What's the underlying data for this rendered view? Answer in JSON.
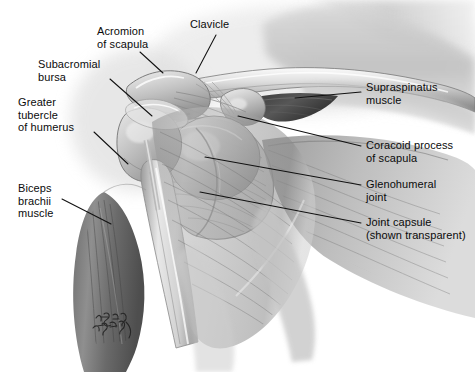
{
  "figure": {
    "view": "anterior right shoulder",
    "style": "grayscale medical illustration",
    "background_color": "#ffffff",
    "leader_line_color": "#111111",
    "text_color": "#0b0b0b",
    "signature": "artist signature"
  },
  "labels": [
    {
      "id": "acromion-of-scapula",
      "line1": "Acromion",
      "line2": "of scapula",
      "side": "left",
      "text_x": 97,
      "text_y": 25,
      "leader": {
        "x1": 140,
        "y1": 52,
        "x2": 163,
        "y2": 73
      }
    },
    {
      "id": "clavicle",
      "line1": "Clavicle",
      "line2": "",
      "side": "left",
      "text_x": 190,
      "text_y": 18,
      "leader": {
        "x1": 216,
        "y1": 35,
        "x2": 196,
        "y2": 73
      }
    },
    {
      "id": "subacromial-bursa",
      "line1": "Subacromial",
      "line2": "bursa",
      "side": "left",
      "text_x": 38,
      "text_y": 58,
      "leader": {
        "x1": 110,
        "y1": 79,
        "x2": 152,
        "y2": 116
      }
    },
    {
      "id": "greater-tubercle-of-humerus",
      "line1": "Greater",
      "line2": "tubercle",
      "line3": "of humerus",
      "side": "left",
      "text_x": 18,
      "text_y": 96,
      "leader": {
        "x1": 94,
        "y1": 132,
        "x2": 128,
        "y2": 164
      }
    },
    {
      "id": "biceps-brachii-muscle",
      "line1": "Biceps",
      "line2": "brachii",
      "line3": "muscle",
      "side": "left",
      "text_x": 18,
      "text_y": 182,
      "leader": {
        "x1": 62,
        "y1": 199,
        "x2": 111,
        "y2": 224
      }
    },
    {
      "id": "supraspinatus-muscle",
      "line1": "Supraspinatus",
      "line2": "muscle",
      "side": "right",
      "text_x": 366,
      "text_y": 81,
      "leader": {
        "x1": 361,
        "y1": 92,
        "x2": 295,
        "y2": 98
      }
    },
    {
      "id": "coracoid-process-of-scapula",
      "line1": "Coracoid process",
      "line2": "of scapula",
      "side": "right",
      "text_x": 366,
      "text_y": 139,
      "leader": {
        "x1": 361,
        "y1": 146,
        "x2": 238,
        "y2": 116
      }
    },
    {
      "id": "glenohumeral-joint",
      "line1": "Glenohumeral",
      "line2": "joint",
      "side": "right",
      "text_x": 366,
      "text_y": 178,
      "leader": {
        "x1": 361,
        "y1": 185,
        "x2": 205,
        "y2": 157
      }
    },
    {
      "id": "joint-capsule",
      "line1": "Joint capsule",
      "line2": "(shown transparent)",
      "side": "right",
      "text_x": 366,
      "text_y": 216,
      "leader": {
        "x1": 361,
        "y1": 223,
        "x2": 200,
        "y2": 192
      }
    }
  ]
}
